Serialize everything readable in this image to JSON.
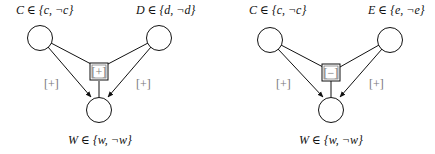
{
  "diagrams": [
    {
      "node_top_left": {
        "var": "C",
        "values": "{c, ¬c}"
      },
      "node_top_right": {
        "var": "D",
        "values": "{d, ¬d}"
      },
      "node_bottom": {
        "var": "W",
        "values": "{w, ¬w}"
      },
      "edge_left_sign": "[+]",
      "edge_right_sign": "[+]",
      "interaction_sign": "[+]"
    },
    {
      "node_top_left": {
        "var": "C",
        "values": "{c, ¬c}"
      },
      "node_top_right": {
        "var": "E",
        "values": "{e, ¬e}"
      },
      "node_bottom": {
        "var": "W",
        "values": "{w, ¬w}"
      },
      "edge_left_sign": "[+]",
      "edge_right_sign": "[+]",
      "interaction_sign": "[−]"
    }
  ],
  "labels": {
    "d1_tl": "C ∈ {c, ¬c}",
    "d1_tr": "D ∈ {d, ¬d}",
    "d1_b": "W ∈ {w, ¬w}",
    "d2_tl": "C ∈ {c, ¬c}",
    "d2_tr": "E ∈ {e, ¬e}",
    "d2_b": "W ∈ {w, ¬w}"
  },
  "colors": {
    "stroke": "#111111",
    "sign": "#777777"
  }
}
